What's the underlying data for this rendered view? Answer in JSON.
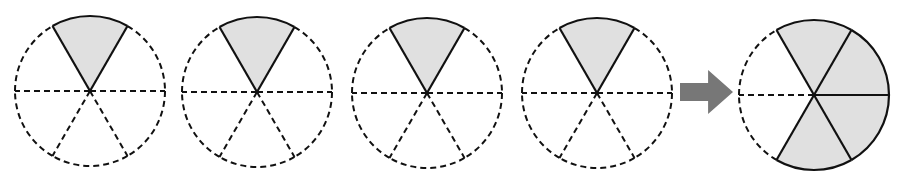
{
  "diagram": {
    "colors": {
      "shade_fill": "#e0e0e0",
      "outline": "#111111",
      "arrow": "#777777",
      "background": "#ffffff"
    },
    "circles": [
      {
        "id": "circle-1",
        "cx": 90,
        "cy": 91,
        "r": 75,
        "divisions": 6,
        "shaded_sectors": [
          0
        ]
      },
      {
        "id": "circle-2",
        "cx": 257,
        "cy": 92,
        "r": 75,
        "divisions": 6,
        "shaded_sectors": [
          0
        ]
      },
      {
        "id": "circle-3",
        "cx": 427,
        "cy": 93,
        "r": 75,
        "divisions": 6,
        "shaded_sectors": [
          0
        ]
      },
      {
        "id": "circle-4",
        "cx": 597,
        "cy": 93,
        "r": 75,
        "divisions": 6,
        "shaded_sectors": [
          0
        ]
      },
      {
        "id": "result-circle",
        "cx": 814,
        "cy": 95,
        "r": 75,
        "divisions": 6,
        "shaded_sectors": [
          0,
          1,
          2,
          3
        ]
      }
    ],
    "arrow": {
      "x_start": 680,
      "x_end": 733,
      "y_center": 92,
      "direction": "right"
    },
    "fractions": {
      "each_part": "1/6",
      "result": "4/6"
    }
  }
}
